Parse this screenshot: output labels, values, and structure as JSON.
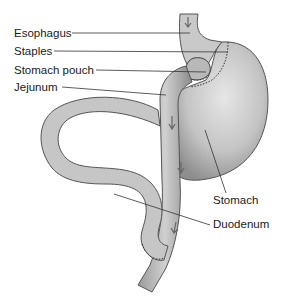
{
  "diagram": {
    "labels": {
      "esophagus": "Esophagus",
      "staples": "Staples",
      "stomach_pouch": "Stomach pouch",
      "jejunum": "Jejunum",
      "stomach": "Stomach",
      "duodenum": "Duodenum"
    },
    "colors": {
      "organ_fill": "#bdbdbd",
      "organ_dark": "#8a8a8a",
      "outline": "#4a4a4a",
      "leader_line": "#333333",
      "text": "#1a1a1a",
      "background": "#ffffff"
    }
  }
}
